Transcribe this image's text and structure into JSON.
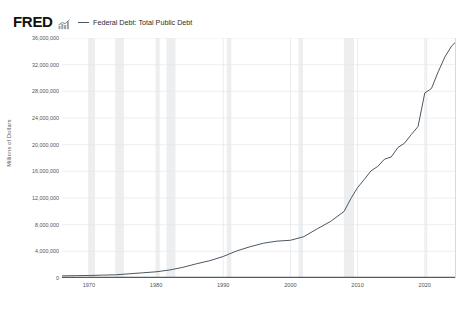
{
  "header": {
    "logo_text": "FRED",
    "logo_mark_icon": "mini-bar-chart-icon"
  },
  "legend": {
    "series_label": "Federal Debt: Total Public Debt",
    "line_color": "#4a5764"
  },
  "axes": {
    "y_title": "Millions of Dollars",
    "y_ticks": [
      "36,000,000",
      "32,000,000",
      "28,000,000",
      "24,000,000",
      "20,000,000",
      "16,000,000",
      "12,000,000",
      "8,000,000",
      "4,000,000",
      "0"
    ],
    "x_ticks": [
      "1970",
      "1980",
      "1990",
      "2000",
      "2010",
      "2020"
    ]
  },
  "colors": {
    "line": "#4a5764",
    "gridline": "#e8e8e8",
    "recession_band": "#eceef0",
    "axis_text": "#555555",
    "zero_axis": "#5a5a5a",
    "frame_border": "#d9d9d9"
  },
  "chart_data": {
    "type": "line",
    "title": "",
    "subtitle": "",
    "xlabel": "",
    "ylabel": "Millions of Dollars",
    "xlim": [
      1966,
      2024.5
    ],
    "ylim": [
      0,
      36000000
    ],
    "grid": true,
    "legend_position": "top",
    "units": "Millions of Dollars",
    "x_tick_values": [
      1970,
      1980,
      1990,
      2000,
      2010,
      2020
    ],
    "y_tick_values": [
      0,
      4000000,
      8000000,
      12000000,
      16000000,
      20000000,
      24000000,
      28000000,
      32000000,
      36000000
    ],
    "series": [
      {
        "name": "Federal Debt: Total Public Debt",
        "color": "#4a5764",
        "x": [
          1966,
          1968,
          1970,
          1972,
          1974,
          1976,
          1978,
          1980,
          1982,
          1984,
          1986,
          1988,
          1990,
          1992,
          1994,
          1996,
          1998,
          2000,
          2002,
          2004,
          2006,
          2008,
          2009,
          2010,
          2011,
          2012,
          2013,
          2014,
          2015,
          2016,
          2017,
          2018,
          2019,
          2020,
          2021,
          2022,
          2023,
          2024,
          2024.5
        ],
        "values": [
          320000,
          350000,
          380000,
          430000,
          480000,
          630000,
          780000,
          930000,
          1200000,
          1600000,
          2130000,
          2600000,
          3230000,
          4060000,
          4690000,
          5220000,
          5530000,
          5660000,
          6200000,
          7380000,
          8500000,
          10000000,
          11900000,
          13560000,
          14790000,
          16070000,
          16740000,
          17820000,
          18150000,
          19570000,
          20240000,
          21520000,
          22720000,
          27750000,
          28430000,
          30930000,
          33170000,
          34800000,
          35300000
        ]
      }
    ],
    "recession_bands": [
      {
        "start": 1969.96,
        "end": 1970.92
      },
      {
        "start": 1973.92,
        "end": 1975.21
      },
      {
        "start": 1980.04,
        "end": 1980.54
      },
      {
        "start": 1981.54,
        "end": 1982.88
      },
      {
        "start": 1990.54,
        "end": 1991.21
      },
      {
        "start": 2001.21,
        "end": 2001.88
      },
      {
        "start": 2007.96,
        "end": 2009.46
      },
      {
        "start": 2020.13,
        "end": 2020.38
      }
    ]
  }
}
